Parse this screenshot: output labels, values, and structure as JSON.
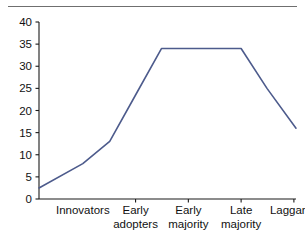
{
  "figure": {
    "name": "diffusion-of-innovation-adoption-curve",
    "line_color": "#4d5b8c",
    "axis_color": "#1a1a1a",
    "rule_color": "#6f6f6f",
    "background": "#ffffff"
  },
  "chart_data": {
    "type": "line",
    "title": "",
    "subtitle": "",
    "xlabel": "",
    "ylabel": "",
    "grid": false,
    "legend": false,
    "categories": [
      "Innovators",
      "Early adopters",
      "Early majority",
      "Late majority",
      "Laggards"
    ],
    "category_labels_wrapped": [
      [
        "Innovators"
      ],
      [
        "Early",
        "adopters"
      ],
      [
        "Early",
        "majority"
      ],
      [
        "Late",
        "majority"
      ],
      [
        "Laggards"
      ]
    ],
    "xlim": [
      -0.83,
      4.04
    ],
    "ylim": [
      0,
      40
    ],
    "yticks": [
      0,
      5,
      10,
      15,
      20,
      25,
      30,
      35,
      40
    ],
    "ytick_labels": [
      "0",
      "5",
      "10",
      "15",
      "20",
      "25",
      "30",
      "35",
      "40"
    ],
    "xtick_positions": [
      0,
      1,
      2,
      3,
      4
    ],
    "series": [
      {
        "name": "adoption",
        "x": [
          -0.83,
          0.0,
          0.51,
          1.0,
          1.49,
          2.0,
          3.0,
          3.49,
          4.04
        ],
        "values": [
          2.5,
          8.0,
          13.0,
          23.5,
          34.0,
          34.0,
          34.0,
          25.0,
          16.0
        ]
      }
    ]
  }
}
